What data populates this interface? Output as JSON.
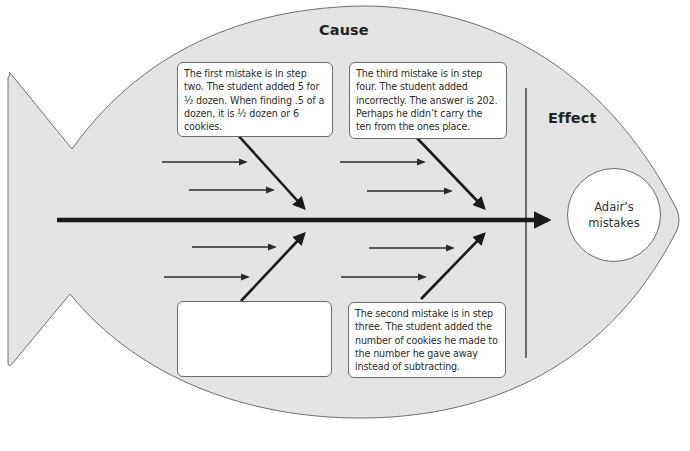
{
  "diagram": {
    "type": "fishbone (cause and effect) diagram",
    "shape": "fish",
    "colors": {
      "fish_fill": "#e4e4e4",
      "fish_outline": "#6f6f6f",
      "arrow": "#1a1a1a",
      "box_fill": "#ffffff",
      "box_border": "#6b6b6b"
    }
  },
  "headings": {
    "cause": "Cause",
    "effect": "Effect"
  },
  "effect": {
    "label": "Adair’s mistakes"
  },
  "causes": {
    "top_left": {
      "text": "The first mistake is in step two. The student added 5 for ½ dozen. When finding .5 of a dozen, it is ½ dozen or 6 cookies."
    },
    "top_right": {
      "text": "The third mistake is in step four. The student added incorrectly. The answer is 202. Perhaps he didn’t carry the ten from the ones place."
    },
    "bottom_left": {
      "text": ""
    },
    "bottom_right": {
      "text": "The second mistake is in step three. The student added the number of cookies he made to the number he gave away instead of subtracting."
    }
  },
  "icons": {
    "spine": "arrow-right-icon",
    "bones": "diagonal-arrow-icon",
    "sub_causes": "small-arrow-right-icon"
  }
}
